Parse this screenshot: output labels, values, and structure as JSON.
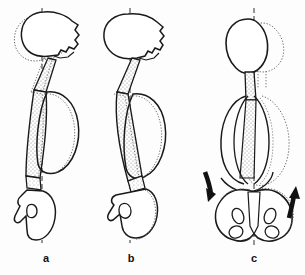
{
  "figure": {
    "type": "anatomical-line-diagram",
    "background_color": "#fdfdfd",
    "ink_color": "#1a1a1a",
    "shade_color": "#c9c9c9",
    "panels": [
      {
        "id": "a",
        "caption": "a",
        "view": "lateral",
        "caption_x": 45,
        "caption_y": 258,
        "center_axis_x": 42,
        "structures": [
          "skull-solid-outline",
          "skull-dotted-displaced-outline",
          "cervical-spine-stippled-column",
          "thoracic-cage-solid-outline",
          "thoracic-cage-dotted-outline",
          "lumbar-spine-stippled-column",
          "pelvis-sacrum-lateral-outline",
          "vertical-dashed-plumb-line"
        ]
      },
      {
        "id": "b",
        "caption": "b",
        "view": "lateral",
        "caption_x": 130,
        "caption_y": 258,
        "center_axis_x": 130,
        "structures": [
          "skull-solid-outline",
          "cervical-spine-stippled-column",
          "thoracic-cage-solid-outline",
          "thoracic-cage-dotted-outline",
          "lumbar-spine-stippled-column",
          "pelvis-sacrum-lateral-outline",
          "pelvis-dotted-outline",
          "vertical-dashed-plumb-line"
        ]
      },
      {
        "id": "c",
        "caption": "c",
        "view": "anterior",
        "caption_x": 253,
        "caption_y": 258,
        "center_axis_x": 254,
        "structures": [
          "skull-solid-outline",
          "skull-dotted-displaced-outline",
          "cervical-spine-stippled-column",
          "thoracic-cage-solid-outline",
          "thoracic-cage-dotted-outline",
          "pelvis-anterior-outline-with-obturator-foramina",
          "pelvis-dotted-outline",
          "rotation-arrow-left-downward",
          "rotation-arrow-right-upward",
          "vertical-dashed-plumb-line"
        ]
      }
    ],
    "annotations": {
      "arrow_left": "curved-arrow-pointing-down",
      "arrow_right": "curved-arrow-pointing-up"
    }
  }
}
